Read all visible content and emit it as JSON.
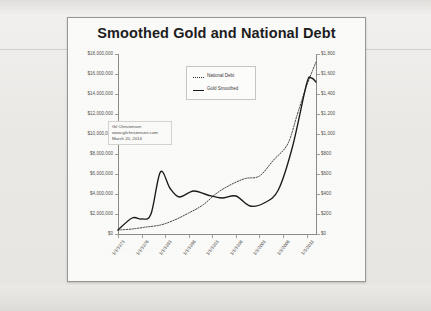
{
  "document": {
    "media": "scanned printed slide",
    "background_color": "#efeeec",
    "slide_background": "#fbfbfa"
  },
  "chart_data": {
    "type": "line",
    "title": "Smoothed Gold and National Debt",
    "xlabel": "",
    "ylabel": "",
    "grid": false,
    "legend_position": "top-center",
    "categories": [
      "1/1/1971",
      "1/1/1976",
      "1/1/1981",
      "1/1/1986",
      "1/1/1991",
      "1/1/1996",
      "1/1/2001",
      "1/1/2006",
      "1/1/2011"
    ],
    "x_tick_labels": [
      "1/1/1971",
      "1/1/1976",
      "1/1/1981",
      "1/1/1986",
      "1/1/1991",
      "1/1/1996",
      "1/1/2001",
      "1/1/2006",
      "1/1/2011"
    ],
    "left_axis": {
      "name": "National Debt",
      "ylim": [
        0,
        18000000
      ],
      "tick_values": [
        0,
        2000000,
        4000000,
        6000000,
        8000000,
        10000000,
        12000000,
        14000000,
        16000000,
        18000000
      ],
      "tick_labels": [
        "$0",
        "$2,000,000",
        "$4,000,000",
        "$6,000,000",
        "$8,000,000",
        "$10,000,000",
        "$12,000,000",
        "$14,000,000",
        "$16,000,000",
        "$18,000,000"
      ]
    },
    "right_axis": {
      "name": "Gold Smoothed",
      "ylim": [
        0,
        1800
      ],
      "tick_values": [
        0,
        200,
        400,
        600,
        800,
        1000,
        1200,
        1400,
        1600,
        1800
      ],
      "tick_labels": [
        "$0",
        "$200",
        "$400",
        "$600",
        "$800",
        "$1,000",
        "$1,200",
        "$1,400",
        "$1,600",
        "$1,800"
      ]
    },
    "series": [
      {
        "name": "National Debt",
        "axis": "left",
        "style": "dotted",
        "color": "#2e2e2e",
        "x": [
          1971,
          1974,
          1977,
          1980,
          1983,
          1986,
          1989,
          1992,
          1995,
          1998,
          2001,
          2004,
          2007,
          2009,
          2011,
          2013
        ],
        "values": [
          400000,
          500000,
          700000,
          900000,
          1400000,
          2100000,
          2900000,
          4100000,
          4950000,
          5550000,
          5800000,
          7400000,
          9000000,
          11900000,
          14800000,
          17200000
        ]
      },
      {
        "name": "Gold Smoothed",
        "axis": "right",
        "style": "solid",
        "color": "#1b1b1b",
        "x": [
          1971,
          1974,
          1976,
          1978,
          1980,
          1982,
          1984,
          1987,
          1990,
          1993,
          1996,
          1999,
          2002,
          2005,
          2008,
          2011,
          2012,
          2013
        ],
        "values": [
          40,
          160,
          150,
          200,
          620,
          460,
          370,
          430,
          390,
          360,
          380,
          280,
          310,
          440,
          870,
          1500,
          1560,
          1520
        ]
      }
    ],
    "annotations": [
      {
        "lines": [
          "Gil Christensen",
          "www.gilchristensen.com",
          "March 20, 2014"
        ]
      }
    ]
  },
  "legend": {
    "items": [
      {
        "label": "National Debt",
        "style": "dotted"
      },
      {
        "label": "Gold Smoothed",
        "style": "solid"
      }
    ]
  }
}
